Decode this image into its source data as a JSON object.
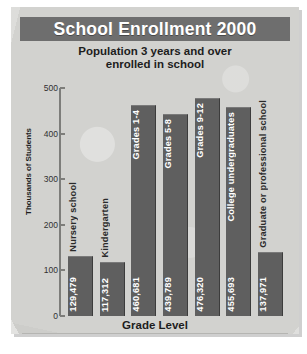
{
  "chart_data": {
    "type": "bar",
    "title": "School Enrollment 2000",
    "subtitle_line1": "Population 3 years and over",
    "subtitle_line2": "enrolled in school",
    "xlabel": "Grade Level",
    "ylabel": "Thousands of Students",
    "ylim": [
      0,
      500
    ],
    "yticks": [
      500,
      400,
      300,
      200,
      100,
      0
    ],
    "ytick_labels": [
      "500",
      "400",
      "300",
      "200",
      "100",
      "0"
    ],
    "grid": false,
    "legend": "none",
    "value_unit": "thousands of students",
    "categories": [
      "Nursery school",
      "Kindergarten",
      "Grades 1-4",
      "Grades 5-8",
      "Grades 9-12",
      "College undergraduates",
      "Graduate or professional school"
    ],
    "values": [
      129.479,
      117.312,
      460.681,
      439.789,
      476.32,
      455.693,
      137.971
    ],
    "value_labels": [
      "129,479",
      "117,312",
      "460,681",
      "439,789",
      "476,320",
      "455,693",
      "137,971"
    ],
    "bars": [
      {
        "category": "Nursery school",
        "value": 129.479,
        "value_label": "129,479",
        "label_inside": false
      },
      {
        "category": "Kindergarten",
        "value": 117.312,
        "value_label": "117,312",
        "label_inside": false
      },
      {
        "category": "Grades 1-4",
        "value": 460.681,
        "value_label": "460,681",
        "label_inside": true
      },
      {
        "category": "Grades 5-8",
        "value": 439.789,
        "value_label": "439,789",
        "label_inside": true
      },
      {
        "category": "Grades 9-12",
        "value": 476.32,
        "value_label": "476,320",
        "label_inside": true
      },
      {
        "category": "College undergraduates",
        "value": 455.693,
        "value_label": "455,693",
        "label_inside": true
      },
      {
        "category": "Graduate or professional school",
        "value": 137.971,
        "value_label": "137,971",
        "label_inside": false
      }
    ]
  },
  "colors": {
    "title_bar": "#6e6e6e",
    "title_text": "#ffffff",
    "bar_fill": "#5f5f5f",
    "panel_background": "#d2d2cf",
    "axis_line": "#7d7d7a",
    "text": "#1d1d1d"
  }
}
